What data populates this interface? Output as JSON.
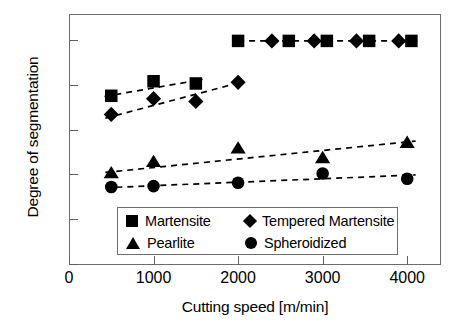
{
  "chart_data": {
    "type": "scatter",
    "title": "",
    "xlabel": "Cutting speed [m/min]",
    "ylabel": "Degree of segmentation",
    "xlim": [
      0,
      4400
    ],
    "ylim": [
      0,
      1.12
    ],
    "xticks": [
      0,
      1000,
      2000,
      3000,
      4000
    ],
    "xtick_labels": [
      "0",
      "1000",
      "2000",
      "3000",
      "4000"
    ],
    "yticks": [
      0,
      0.2,
      0.4,
      0.6,
      0.8,
      1.0
    ],
    "ytick_labels": [
      "0",
      "0.2",
      "0.4",
      "0.6",
      "0.8",
      "1.0"
    ],
    "grid": false,
    "legend_position": "lower center",
    "series": [
      {
        "name": "Martensite",
        "marker": "square",
        "color": "#000000",
        "x": [
          500,
          1000,
          1500,
          2000,
          2600,
          3050,
          3550,
          4050
        ],
        "y": [
          0.755,
          0.82,
          0.81,
          1.0,
          1.0,
          1.0,
          1.0,
          1.0
        ],
        "trend": {
          "x": [
            420,
            1580
          ],
          "y": [
            0.752,
            0.828
          ]
        }
      },
      {
        "name": "Tempered Martensite",
        "marker": "diamond",
        "color": "#000000",
        "x": [
          500,
          1000,
          1500,
          2000,
          2400,
          2900,
          3400,
          3900
        ],
        "y": [
          0.672,
          0.742,
          0.73,
          0.815,
          1.0,
          1.0,
          1.0,
          1.0
        ],
        "trend": {
          "x": [
            430,
            2060
          ],
          "y": [
            0.655,
            0.818
          ]
        }
      },
      {
        "name": "Pearlite",
        "marker": "triangle",
        "color": "#000000",
        "x": [
          500,
          1000,
          2000,
          3000,
          4000
        ],
        "y": [
          0.408,
          0.458,
          0.518,
          0.475,
          0.543
        ],
        "trend": {
          "x": [
            430,
            4100
          ],
          "y": [
            0.413,
            0.553
          ]
        }
      },
      {
        "name": "Spheroidized",
        "marker": "circle",
        "color": "#000000",
        "x": [
          500,
          1000,
          2000,
          3000,
          4000
        ],
        "y": [
          0.348,
          0.352,
          0.367,
          0.408,
          0.385
        ],
        "trend": {
          "x": [
            430,
            4100
          ],
          "y": [
            0.345,
            0.402
          ]
        }
      }
    ],
    "dashed_top_connector": {
      "x": [
        2000,
        4050
      ],
      "y": [
        1.0,
        1.0
      ]
    }
  },
  "legend": {
    "entries": [
      {
        "label": "Martensite",
        "marker": "square"
      },
      {
        "label": "Tempered Martensite",
        "marker": "diamond"
      },
      {
        "label": "Pearlite",
        "marker": "triangle"
      },
      {
        "label": "Spheroidized",
        "marker": "circle"
      }
    ]
  }
}
